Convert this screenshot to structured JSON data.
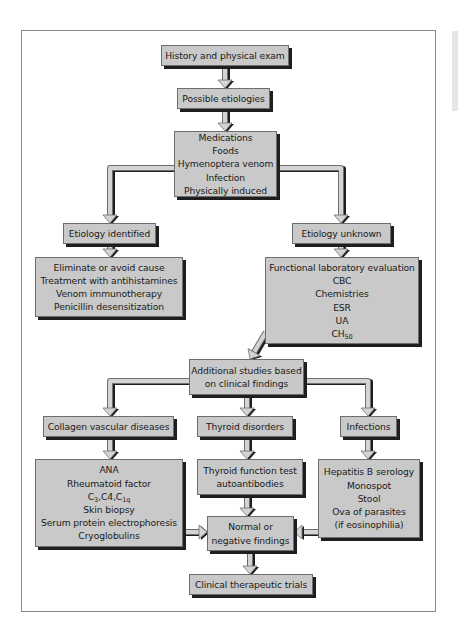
{
  "colors": {
    "box_fill": "#c9c9c9",
    "box_border": "#6e6e6e",
    "shadow": "#1e1e1e",
    "arrow_fill": "#d4d4d4",
    "frame_border": "#8a8a8a"
  },
  "nodes": {
    "history": {
      "lines": [
        "History and physical exam"
      ]
    },
    "possible": {
      "lines": [
        "Possible etiologies"
      ]
    },
    "etiologies_list": {
      "lines": [
        "Medications",
        "Foods",
        "Hymenoptera venom",
        "Infection",
        "Physically induced"
      ]
    },
    "identified": {
      "lines": [
        "Etiology identified"
      ]
    },
    "unknown": {
      "lines": [
        "Etiology unknown"
      ]
    },
    "treatment": {
      "lines": [
        "Eliminate or avoid cause",
        "Treatment with antihistamines",
        "Venom immunotherapy",
        "Penicillin desensitization"
      ]
    },
    "lab_eval": {
      "lines": [
        "Functional laboratory evaluation",
        "CBC",
        "Chemistries",
        "ESR",
        "UA"
      ],
      "ch50": {
        "base": "CH",
        "sub": "50"
      }
    },
    "additional": {
      "lines": [
        "Additional studies based",
        "on clinical findings"
      ]
    },
    "collagen": {
      "lines": [
        "Collagen vascular diseases"
      ]
    },
    "thyroid": {
      "lines": [
        "Thyroid disorders"
      ]
    },
    "infections": {
      "lines": [
        "Infections"
      ]
    },
    "collagen_tests": {
      "lines_before": [
        "ANA",
        "Rheumatoid factor"
      ],
      "complement": {
        "c3": "C",
        "c3_sub": "3",
        "sep1": ",C4,",
        "c1q": "C",
        "c1q_sub": "1q"
      },
      "lines_after": [
        "Skin biopsy",
        "Serum protein electrophoresis",
        "Cryoglobulins"
      ]
    },
    "thyroid_tests": {
      "lines": [
        "Thyroid function test",
        "autoantibodies"
      ]
    },
    "infection_tests": {
      "lines": [
        "Hepatitis B serology",
        "Monospot",
        "Stool",
        "Ova of parasites",
        "(if eosinophilia)"
      ]
    },
    "normal": {
      "lines": [
        "Normal or",
        "negative findings"
      ]
    },
    "trials": {
      "lines": [
        "Clinical therapeutic trials"
      ]
    }
  },
  "edges": [
    [
      "history",
      "possible"
    ],
    [
      "possible",
      "etiologies_list"
    ],
    [
      "etiologies_list",
      "identified"
    ],
    [
      "etiologies_list",
      "unknown"
    ],
    [
      "identified",
      "treatment"
    ],
    [
      "unknown",
      "lab_eval"
    ],
    [
      "lab_eval",
      "additional"
    ],
    [
      "additional",
      "collagen"
    ],
    [
      "additional",
      "thyroid"
    ],
    [
      "additional",
      "infections"
    ],
    [
      "collagen",
      "collagen_tests"
    ],
    [
      "thyroid",
      "thyroid_tests"
    ],
    [
      "infections",
      "infection_tests"
    ],
    [
      "collagen_tests",
      "normal"
    ],
    [
      "thyroid_tests",
      "normal"
    ],
    [
      "infection_tests",
      "normal"
    ],
    [
      "normal",
      "trials"
    ]
  ]
}
